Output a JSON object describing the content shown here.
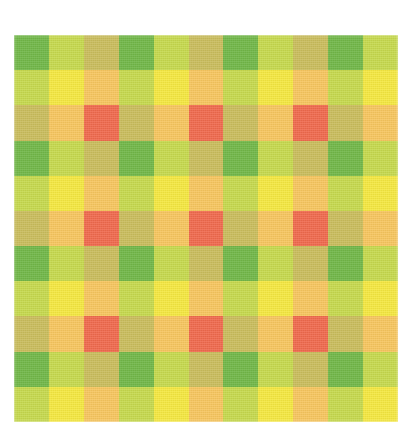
{
  "image": {
    "subject": "gingham-plaid-fabric-swatch",
    "background_color": "#ffffff",
    "width": 416,
    "height": 431
  },
  "swatch": {
    "left": 14,
    "top": 35,
    "width": 384,
    "height": 387,
    "columns": 11,
    "rows": 11,
    "cell_size": 35
  },
  "palette": {
    "green": "#6cb644",
    "yellow_green": "#c5d94a",
    "olive_tan": "#c9bc5a",
    "bright_yellow": "#f5e83c",
    "gold": "#f7c55c",
    "red_orange": "#f0654a",
    "background": "#ffffff"
  },
  "weave": {
    "stripe_sequence": [
      "green",
      "yellow",
      "tan"
    ],
    "warp_stripes": [
      "green",
      "yellow",
      "tan",
      "green",
      "yellow",
      "tan",
      "green",
      "yellow",
      "tan",
      "green",
      "yellow"
    ],
    "weft_stripes": [
      "green",
      "yellow",
      "tan",
      "green",
      "yellow",
      "tan",
      "green",
      "yellow",
      "tan",
      "green",
      "yellow"
    ],
    "blend_matrix": {
      "green|green": "#6cb644",
      "green|yellow": "#c5d94a",
      "green|tan": "#c9bc5a",
      "yellow|green": "#c5d94a",
      "yellow|yellow": "#f5e83c",
      "yellow|tan": "#f7c55c",
      "tan|green": "#c9bc5a",
      "tan|yellow": "#f7c55c",
      "tan|tan": "#f0654a"
    }
  },
  "grid_colors": [
    [
      "#6cb644",
      "#c5d94a",
      "#c9bc5a",
      "#6cb644",
      "#c5d94a",
      "#c9bc5a",
      "#6cb644",
      "#c5d94a",
      "#c9bc5a",
      "#6cb644",
      "#c5d94a"
    ],
    [
      "#c5d94a",
      "#f5e83c",
      "#f7c55c",
      "#c5d94a",
      "#f5e83c",
      "#f7c55c",
      "#c5d94a",
      "#f5e83c",
      "#f7c55c",
      "#c5d94a",
      "#f5e83c"
    ],
    [
      "#c9bc5a",
      "#f7c55c",
      "#f0654a",
      "#c9bc5a",
      "#f7c55c",
      "#f0654a",
      "#c9bc5a",
      "#f7c55c",
      "#f0654a",
      "#c9bc5a",
      "#f7c55c"
    ],
    [
      "#6cb644",
      "#c5d94a",
      "#c9bc5a",
      "#6cb644",
      "#c5d94a",
      "#c9bc5a",
      "#6cb644",
      "#c5d94a",
      "#c9bc5a",
      "#6cb644",
      "#c5d94a"
    ],
    [
      "#c5d94a",
      "#f5e83c",
      "#f7c55c",
      "#c5d94a",
      "#f5e83c",
      "#f7c55c",
      "#c5d94a",
      "#f5e83c",
      "#f7c55c",
      "#c5d94a",
      "#f5e83c"
    ],
    [
      "#c9bc5a",
      "#f7c55c",
      "#f0654a",
      "#c9bc5a",
      "#f7c55c",
      "#f0654a",
      "#c9bc5a",
      "#f7c55c",
      "#f0654a",
      "#c9bc5a",
      "#f7c55c"
    ],
    [
      "#6cb644",
      "#c5d94a",
      "#c9bc5a",
      "#6cb644",
      "#c5d94a",
      "#c9bc5a",
      "#6cb644",
      "#c5d94a",
      "#c9bc5a",
      "#6cb644",
      "#c5d94a"
    ],
    [
      "#c5d94a",
      "#f5e83c",
      "#f7c55c",
      "#c5d94a",
      "#f5e83c",
      "#f7c55c",
      "#c5d94a",
      "#f5e83c",
      "#f7c55c",
      "#c5d94a",
      "#f5e83c"
    ],
    [
      "#c9bc5a",
      "#f7c55c",
      "#f0654a",
      "#c9bc5a",
      "#f7c55c",
      "#f0654a",
      "#c9bc5a",
      "#f7c55c",
      "#f0654a",
      "#c9bc5a",
      "#f7c55c"
    ],
    [
      "#6cb644",
      "#c5d94a",
      "#c9bc5a",
      "#6cb644",
      "#c5d94a",
      "#c9bc5a",
      "#6cb644",
      "#c5d94a",
      "#c9bc5a",
      "#6cb644",
      "#c5d94a"
    ],
    [
      "#c5d94a",
      "#f5e83c",
      "#f7c55c",
      "#c5d94a",
      "#f5e83c",
      "#f7c55c",
      "#c5d94a",
      "#f5e83c",
      "#f7c55c",
      "#c5d94a",
      "#f5e83c"
    ]
  ]
}
